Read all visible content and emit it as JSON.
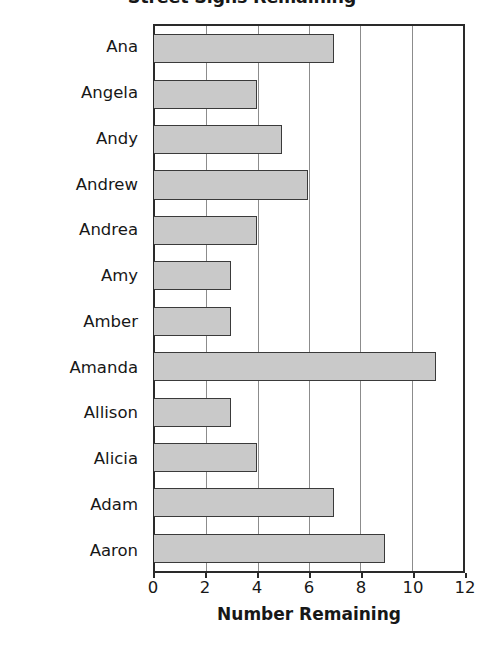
{
  "chart_data": {
    "type": "bar",
    "orientation": "horizontal",
    "title": "Street Signs Remaining",
    "xlabel": "Number Remaining",
    "ylabel": "Name",
    "categories": [
      "Ana",
      "Angela",
      "Andy",
      "Andrew",
      "Andrea",
      "Amy",
      "Amber",
      "Amanda",
      "Allison",
      "Alicia",
      "Adam",
      "Aaron"
    ],
    "values": [
      7,
      4,
      5,
      6,
      4,
      3,
      3,
      11,
      3,
      4,
      7,
      9
    ],
    "xlim": [
      0,
      12
    ],
    "xticks": [
      0,
      2,
      4,
      6,
      8,
      10,
      12
    ],
    "xtick_labels": [
      "0",
      "2",
      "4",
      "6",
      "8",
      "10",
      "12"
    ],
    "grid": "vertical",
    "legend": "none",
    "bar_fill_color": "#c9c9c9",
    "bar_border_color": "#3a3a3a",
    "axis_color": "#2a2a2a",
    "gridline_color": "#8c8c8c",
    "background_color": "#ffffff"
  }
}
